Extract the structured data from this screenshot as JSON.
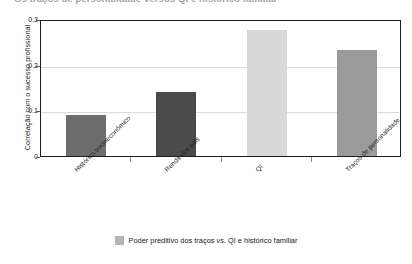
{
  "clipped_title": "Os traços de personalidade versus QI e histórico familiar",
  "chart_data": {
    "type": "bar",
    "title": "",
    "xlabel": "",
    "ylabel": "Correlação com o sucesso profissional",
    "ylim": [
      0,
      0.3
    ],
    "yticks": [
      "0",
      "0.1",
      "0.2",
      "0.3"
    ],
    "ytick_values": [
      0,
      0.1,
      0.2,
      0.3
    ],
    "grid": true,
    "legend_position": "bottom-center",
    "categories": [
      "Histórico socioeconômico",
      "Renda dos pais",
      "QI",
      "Traços de personalidade"
    ],
    "values": [
      0.09,
      0.14,
      0.275,
      0.233
    ],
    "bar_colors": [
      "#6d6d6d",
      "#4b4b4b",
      "#d8d8d8",
      "#9b9b9b"
    ],
    "legend": [
      {
        "label_prefix": "Poder preditivo dos traços ",
        "label_italic": "vs.",
        "label_suffix": " QI e histórico familiar",
        "color": "#b5b5b5"
      }
    ]
  },
  "colors": {
    "axis": "#1d1d1d",
    "gridline": "#dcdcdc",
    "background": "#ffffff",
    "text": "#1a1a1a"
  }
}
